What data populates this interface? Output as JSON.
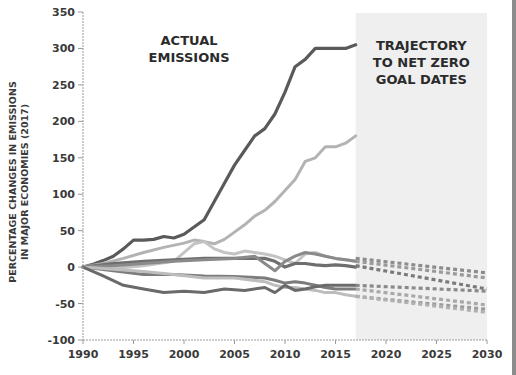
{
  "chart_data": {
    "type": "line",
    "title": "",
    "xlabel": "",
    "ylabel": "PERCENTAGE CHANGES IN EMISSIONS IN MAJOR ECONOMIES (2017)",
    "ylabel_lines": [
      "PERCENTAGE CHANGES IN EMISSIONS",
      "IN MAJOR ECONOMIES (2017)"
    ],
    "xlim": [
      1990,
      2030
    ],
    "ylim": [
      -100,
      350
    ],
    "x_ticks": [
      1990,
      1995,
      2000,
      2005,
      2010,
      2015,
      2020,
      2025,
      2030
    ],
    "y_ticks": [
      -100,
      -50,
      0,
      50,
      100,
      150,
      200,
      250,
      300,
      350
    ],
    "grid": false,
    "legend": null,
    "shaded_region": {
      "x_start": 2017,
      "x_end": 2030,
      "color": "#efefef"
    },
    "annotations": [
      {
        "text_lines": [
          "ACTUAL",
          "EMISSIONS"
        ],
        "x": 2000.5,
        "y": 305
      },
      {
        "text_lines": [
          "TRAJECTORY",
          "TO NET ZERO",
          "GOAL DATES"
        ],
        "x": 2023.5,
        "y": 298
      }
    ],
    "series": [
      {
        "name": "series-1-dark-top",
        "color": "#5a5a5a",
        "width": 3.2,
        "x": [
          1990,
          1991,
          1992,
          1993,
          1994,
          1995,
          1996,
          1997,
          1998,
          1999,
          2000,
          2001,
          2002,
          2003,
          2004,
          2005,
          2006,
          2007,
          2008,
          2009,
          2010,
          2011,
          2012,
          2013,
          2014,
          2015,
          2016,
          2017
        ],
        "values": [
          0,
          4,
          9,
          15,
          25,
          37,
          37,
          38,
          42,
          40,
          45,
          55,
          65,
          90,
          115,
          140,
          160,
          180,
          190,
          210,
          240,
          275,
          285,
          300,
          300,
          300,
          300,
          305
        ]
      },
      {
        "name": "series-2-light-top",
        "color": "#b3b3b3",
        "width": 3,
        "x": [
          1990,
          1992,
          1994,
          1996,
          1998,
          2000,
          2001,
          2002,
          2003,
          2004,
          2005,
          2006,
          2007,
          2008,
          2009,
          2010,
          2011,
          2012,
          2013,
          2014,
          2015,
          2016,
          2017
        ],
        "values": [
          0,
          5,
          12,
          20,
          27,
          33,
          37,
          35,
          32,
          38,
          48,
          58,
          70,
          78,
          90,
          105,
          120,
          145,
          150,
          165,
          165,
          170,
          180
        ]
      },
      {
        "name": "series-3-light-mid",
        "color": "#c4c4c4",
        "width": 3,
        "x": [
          1990,
          1993,
          1996,
          1999,
          2001,
          2002,
          2003,
          2004,
          2005,
          2006,
          2007,
          2008,
          2009,
          2010,
          2011,
          2012,
          2013,
          2014,
          2015,
          2016,
          2017
        ],
        "values": [
          0,
          -2,
          2,
          8,
          32,
          35,
          25,
          20,
          18,
          22,
          20,
          18,
          15,
          10,
          5,
          18,
          20,
          15,
          12,
          10,
          8
        ]
      },
      {
        "name": "series-4-dark-flat",
        "color": "#6e6e6e",
        "width": 3.2,
        "x": [
          1990,
          1993,
          1996,
          1999,
          2002,
          2005,
          2008,
          2009,
          2010,
          2011,
          2012,
          2013,
          2014,
          2015,
          2016,
          2017
        ],
        "values": [
          0,
          5,
          8,
          10,
          12,
          12,
          12,
          8,
          0,
          5,
          5,
          3,
          2,
          3,
          2,
          0
        ]
      },
      {
        "name": "series-5-mid-gray",
        "color": "#8a8a8a",
        "width": 3,
        "x": [
          1990,
          1993,
          1996,
          1999,
          2002,
          2005,
          2007,
          2008,
          2009,
          2010,
          2011,
          2012,
          2013,
          2014,
          2015,
          2016,
          2017
        ],
        "values": [
          0,
          2,
          5,
          8,
          10,
          12,
          15,
          5,
          -5,
          8,
          15,
          20,
          18,
          15,
          12,
          10,
          8
        ]
      },
      {
        "name": "series-6-mid-down",
        "color": "#7c7c7c",
        "width": 3,
        "x": [
          1990,
          1993,
          1996,
          1999,
          2002,
          2005,
          2008,
          2009,
          2010,
          2011,
          2012,
          2013,
          2014,
          2015,
          2016,
          2017
        ],
        "values": [
          0,
          -5,
          -10,
          -10,
          -12,
          -13,
          -15,
          -18,
          -22,
          -20,
          -22,
          -25,
          -28,
          -30,
          -30,
          -30
        ]
      },
      {
        "name": "series-7-light-down",
        "color": "#bdbdbd",
        "width": 3,
        "x": [
          1990,
          1993,
          1996,
          1999,
          2002,
          2005,
          2008,
          2009,
          2010,
          2011,
          2012,
          2013,
          2014,
          2015,
          2016,
          2017
        ],
        "values": [
          0,
          -3,
          -6,
          -10,
          -15,
          -15,
          -20,
          -25,
          -28,
          -28,
          -30,
          -32,
          -35,
          -35,
          -38,
          -40
        ]
      },
      {
        "name": "series-8-dark-bottom",
        "color": "#6a6a6a",
        "width": 3,
        "x": [
          1990,
          1992,
          1994,
          1996,
          1998,
          2000,
          2002,
          2004,
          2006,
          2008,
          2009,
          2010,
          2011,
          2012,
          2013,
          2014,
          2015,
          2016,
          2017
        ],
        "values": [
          0,
          -12,
          -25,
          -30,
          -35,
          -33,
          -35,
          -30,
          -32,
          -28,
          -35,
          -25,
          -32,
          -30,
          -27,
          -25,
          -25,
          -25,
          -25
        ]
      }
    ],
    "projections": [
      {
        "name": "projection-1",
        "color": "#8c8c8c",
        "x": [
          2017,
          2030
        ],
        "values": [
          12,
          -8
        ]
      },
      {
        "name": "projection-2",
        "color": "#9a9a9a",
        "x": [
          2017,
          2030
        ],
        "values": [
          8,
          -15
        ]
      },
      {
        "name": "projection-3",
        "color": "#7a7a7a",
        "x": [
          2017,
          2030
        ],
        "values": [
          2,
          -30
        ]
      },
      {
        "name": "projection-4",
        "color": "#8a8a8a",
        "x": [
          2017,
          2030
        ],
        "values": [
          -25,
          -33
        ]
      },
      {
        "name": "projection-5",
        "color": "#a8a8a8",
        "x": [
          2017,
          2030
        ],
        "values": [
          -30,
          -52
        ]
      },
      {
        "name": "projection-6",
        "color": "#9a9a9a",
        "x": [
          2017,
          2030
        ],
        "values": [
          -40,
          -58
        ]
      },
      {
        "name": "projection-7",
        "color": "#b0b0b0",
        "x": [
          2017,
          2030
        ],
        "values": [
          -40,
          -62
        ]
      }
    ]
  },
  "layout": {
    "plot": {
      "x0": 83,
      "x1": 487,
      "y_top": 12,
      "y_bottom": 340
    },
    "axis_color": "#9a9a9a"
  }
}
